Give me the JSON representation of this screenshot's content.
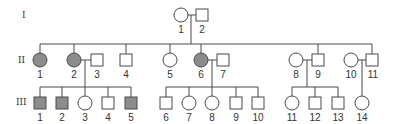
{
  "diagram": {
    "type": "pedigree",
    "colors": {
      "line": "#4a4a4a",
      "affected": "#8c8c8c",
      "unaffected": "#ffffff"
    },
    "generations": [
      {
        "label": "I",
        "individuals": [
          {
            "id": "1",
            "sex": "female",
            "affected": false
          },
          {
            "id": "2",
            "sex": "male",
            "affected": false
          }
        ]
      },
      {
        "label": "II",
        "individuals": [
          {
            "id": "1",
            "sex": "female",
            "affected": true
          },
          {
            "id": "2",
            "sex": "female",
            "affected": true
          },
          {
            "id": "3",
            "sex": "male",
            "affected": false
          },
          {
            "id": "4",
            "sex": "male",
            "affected": false
          },
          {
            "id": "5",
            "sex": "female",
            "affected": false
          },
          {
            "id": "6",
            "sex": "female",
            "affected": true
          },
          {
            "id": "7",
            "sex": "male",
            "affected": false
          },
          {
            "id": "8",
            "sex": "female",
            "affected": false
          },
          {
            "id": "9",
            "sex": "male",
            "affected": false
          },
          {
            "id": "10",
            "sex": "female",
            "affected": false
          },
          {
            "id": "11",
            "sex": "male",
            "affected": false
          }
        ]
      },
      {
        "label": "III",
        "individuals": [
          {
            "id": "1",
            "sex": "male",
            "affected": true
          },
          {
            "id": "2",
            "sex": "male",
            "affected": true
          },
          {
            "id": "3",
            "sex": "female",
            "affected": false
          },
          {
            "id": "4",
            "sex": "male",
            "affected": false
          },
          {
            "id": "5",
            "sex": "male",
            "affected": true
          },
          {
            "id": "6",
            "sex": "male",
            "affected": false
          },
          {
            "id": "7",
            "sex": "female",
            "affected": false
          },
          {
            "id": "8",
            "sex": "female",
            "affected": false
          },
          {
            "id": "9",
            "sex": "male",
            "affected": false
          },
          {
            "id": "10",
            "sex": "male",
            "affected": false
          },
          {
            "id": "11",
            "sex": "female",
            "affected": false
          },
          {
            "id": "12",
            "sex": "male",
            "affected": false
          },
          {
            "id": "13",
            "sex": "male",
            "affected": false
          },
          {
            "id": "14",
            "sex": "female",
            "affected": false
          }
        ]
      }
    ],
    "matings": [
      {
        "parents": [
          "I-1",
          "I-2"
        ],
        "children": [
          "II-1",
          "II-2",
          "II-4",
          "II-5",
          "II-6",
          "II-9",
          "II-11"
        ]
      },
      {
        "parents": [
          "II-2",
          "II-3"
        ],
        "children": [
          "III-1",
          "III-2",
          "III-3",
          "III-4",
          "III-5"
        ]
      },
      {
        "parents": [
          "II-6",
          "II-7"
        ],
        "children": [
          "III-6",
          "III-7",
          "III-8",
          "III-9",
          "III-10"
        ]
      },
      {
        "parents": [
          "II-8",
          "II-9"
        ],
        "children": [
          "III-11",
          "III-12",
          "III-13"
        ]
      },
      {
        "parents": [
          "II-10",
          "II-11"
        ],
        "children": [
          "III-14"
        ]
      }
    ]
  }
}
